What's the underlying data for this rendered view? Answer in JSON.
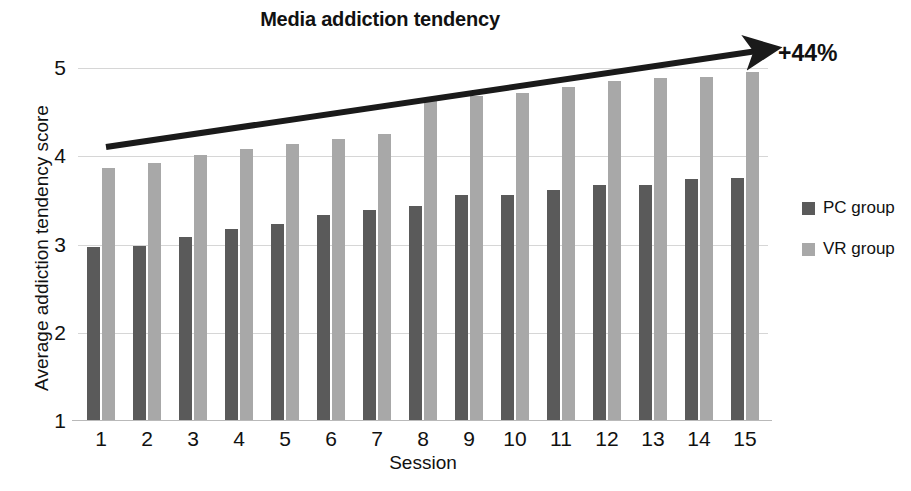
{
  "chart_data": {
    "type": "bar",
    "title": "Media addiction tendency",
    "xlabel": "Session",
    "ylabel": "Average addiction tendency score",
    "categories": [
      "1",
      "2",
      "3",
      "4",
      "5",
      "6",
      "7",
      "8",
      "9",
      "10",
      "11",
      "12",
      "13",
      "14",
      "15"
    ],
    "yticks": [
      "1",
      "2",
      "3",
      "4",
      "5"
    ],
    "ylim": [
      1,
      5
    ],
    "grid": true,
    "legend_position": "right",
    "series": [
      {
        "name": "PC group",
        "color": "#5a5a5a",
        "values": [
          2.97,
          2.98,
          3.08,
          3.18,
          3.23,
          3.34,
          3.39,
          3.44,
          3.56,
          3.56,
          3.62,
          3.68,
          3.68,
          3.74,
          3.75
        ]
      },
      {
        "name": "VR group",
        "color": "#a8a8a8",
        "values": [
          3.87,
          3.92,
          4.02,
          4.08,
          4.14,
          4.2,
          4.25,
          4.64,
          4.68,
          4.72,
          4.78,
          4.85,
          4.89,
          4.9,
          4.96
        ]
      }
    ],
    "annotations": [
      {
        "name": "trend-arrow-label",
        "text": "+44%",
        "description": "upward trend arrow spanning session 1 to session 15"
      }
    ]
  }
}
